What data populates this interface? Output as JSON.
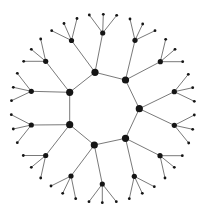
{
  "diagram": {
    "type": "tree-graph",
    "width": 205,
    "height": 211,
    "colors": {
      "edge": "#6a6a6a",
      "node": "#151515",
      "background": "#ffffff"
    },
    "node_radius": {
      "inner": 3.6,
      "middle": 2.6,
      "leaf": 1.4
    },
    "inner_ring": [
      {
        "id": "I0",
        "x": 95.0,
        "y": 72.3
      },
      {
        "id": "I1",
        "x": 125.5,
        "y": 80.0
      },
      {
        "id": "I2",
        "x": 139.3,
        "y": 108.7
      },
      {
        "id": "I3",
        "x": 125.5,
        "y": 138.3
      },
      {
        "id": "I4",
        "x": 94.3,
        "y": 145.0
      },
      {
        "id": "I5",
        "x": 69.7,
        "y": 124.7
      },
      {
        "id": "I6",
        "x": 69.7,
        "y": 92.3
      }
    ],
    "middle": [
      {
        "id": "M0",
        "parent": "I0",
        "x": 71.5,
        "y": 40.5,
        "leaves": [
          [
            51.7,
            30.7
          ],
          [
            64.0,
            23.5
          ],
          [
            77.0,
            18.5
          ]
        ]
      },
      {
        "id": "M1",
        "parent": "I0",
        "x": 102.7,
        "y": 33.0,
        "leaves": [
          [
            89.3,
            15.0
          ],
          [
            103.3,
            14.3
          ],
          [
            116.7,
            15.3
          ]
        ]
      },
      {
        "id": "M2",
        "parent": "I1",
        "x": 135.0,
        "y": 40.3,
        "leaves": [
          [
            130.0,
            19.0
          ],
          [
            142.7,
            24.0
          ],
          [
            155.0,
            30.7
          ]
        ]
      },
      {
        "id": "M3",
        "parent": "I1",
        "x": 160.3,
        "y": 61.7,
        "leaves": [
          [
            165.7,
            39.3
          ],
          [
            175.0,
            49.3
          ],
          [
            182.7,
            61.7
          ]
        ]
      },
      {
        "id": "M4",
        "parent": "I2",
        "x": 174.3,
        "y": 91.7,
        "leaves": [
          [
            188.3,
            74.3
          ],
          [
            192.7,
            87.7
          ],
          [
            194.3,
            101.3
          ]
        ]
      },
      {
        "id": "M5",
        "parent": "I2",
        "x": 174.3,
        "y": 125.3,
        "leaves": [
          [
            194.3,
            115.0
          ],
          [
            192.7,
            129.3
          ],
          [
            188.7,
            143.0
          ]
        ]
      },
      {
        "id": "M6",
        "parent": "I3",
        "x": 160.0,
        "y": 155.7,
        "leaves": [
          [
            182.3,
            155.7
          ],
          [
            174.3,
            167.3
          ],
          [
            165.0,
            178.0
          ]
        ]
      },
      {
        "id": "M7",
        "parent": "I3",
        "x": 134.3,
        "y": 176.3,
        "leaves": [
          [
            154.3,
            186.7
          ],
          [
            142.3,
            193.3
          ],
          [
            129.3,
            198.7
          ]
        ]
      },
      {
        "id": "M8",
        "parent": "I4",
        "x": 102.3,
        "y": 184.0,
        "leaves": [
          [
            89.0,
            201.7
          ],
          [
            102.3,
            202.7
          ],
          [
            116.3,
            201.7
          ]
        ]
      },
      {
        "id": "M9",
        "parent": "I4",
        "x": 71.0,
        "y": 176.0,
        "leaves": [
          [
            51.0,
            186.0
          ],
          [
            62.7,
            193.3
          ],
          [
            75.7,
            198.7
          ]
        ]
      },
      {
        "id": "M10",
        "parent": "I5",
        "x": 45.7,
        "y": 155.5,
        "leaves": [
          [
            23.3,
            155.5
          ],
          [
            31.3,
            167.3
          ],
          [
            40.7,
            178.0
          ]
        ]
      },
      {
        "id": "M11",
        "parent": "I5",
        "x": 31.3,
        "y": 125.0,
        "leaves": [
          [
            11.3,
            114.7
          ],
          [
            13.3,
            129.0
          ],
          [
            17.3,
            142.7
          ]
        ]
      },
      {
        "id": "M12",
        "parent": "I6",
        "x": 31.3,
        "y": 91.3,
        "leaves": [
          [
            17.3,
            73.3
          ],
          [
            13.3,
            87.3
          ],
          [
            11.5,
            100.7
          ]
        ]
      },
      {
        "id": "M13",
        "parent": "I6",
        "x": 45.7,
        "y": 61.3,
        "leaves": [
          [
            40.7,
            39.0
          ],
          [
            31.3,
            49.3
          ],
          [
            23.7,
            61.3
          ]
        ]
      }
    ]
  }
}
